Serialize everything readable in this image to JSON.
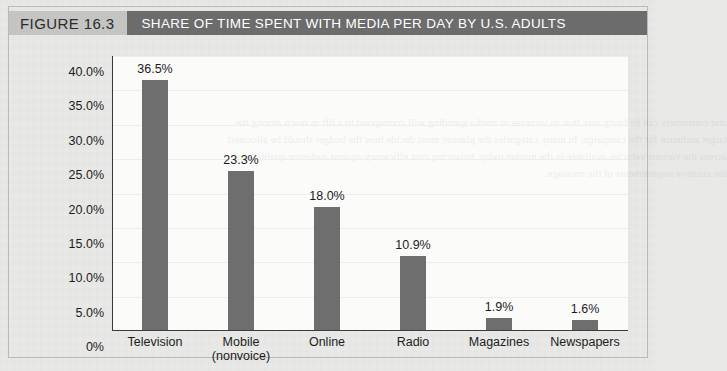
{
  "figure": {
    "number_label": "FIGURE 16.3",
    "title": "SHARE OF TIME SPENT WITH MEDIA PER DAY BY U.S. ADULTS",
    "number_box_color": "#c4c4c2",
    "title_box_color": "#6c6c6c",
    "title_text_color": "#ffffff",
    "page_background": "#e9e9e7",
    "plot_background": "#fbfbfa"
  },
  "chart_data": {
    "type": "bar",
    "title": "SHARE OF TIME SPENT WITH MEDIA PER DAY BY U.S. ADULTS",
    "xlabel": "",
    "ylabel": "",
    "categories": [
      "Television",
      "Mobile (nonvoice)",
      "Online",
      "Radio",
      "Magazines",
      "Newspapers"
    ],
    "category_lines": [
      [
        "Television"
      ],
      [
        "Mobile",
        "(nonvoice)"
      ],
      [
        "Online"
      ],
      [
        "Radio"
      ],
      [
        "Magazines"
      ],
      [
        "Newspapers"
      ]
    ],
    "values": [
      36.5,
      23.3,
      18.0,
      10.9,
      1.9,
      1.6
    ],
    "data_labels": [
      "36.5%",
      "23.3%",
      "18.0%",
      "10.9%",
      "1.9%",
      "1.6%"
    ],
    "ylim": [
      0,
      40
    ],
    "ytick_values": [
      40.0,
      35.0,
      30.0,
      25.0,
      20.0,
      15.0,
      10.0,
      5.0,
      0
    ],
    "ytick_labels": [
      "40.0%",
      "35.0%",
      "30.0%",
      "25.0%",
      "20.0%",
      "15.0%",
      "10.0%",
      "5.0%",
      "0%"
    ],
    "grid": true,
    "legend": null,
    "bar_color": "#6e6e6e",
    "axis_color": "#3a3a3a",
    "gridline_color": "#ededeb"
  },
  "bleed_text": "and consumers can be fairly sure that an increase in media spending will correspond to a lift in reach among the target audience for the campaign. In many categories the planner must decide how the budget should be allocated across the various vehicles available in the market today, balancing cost efficiency against audience quality and the creative requirements of the message."
}
